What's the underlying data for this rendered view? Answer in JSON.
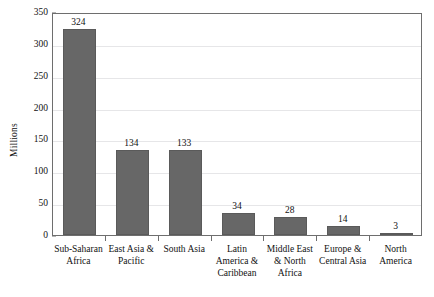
{
  "chart_data": {
    "type": "bar",
    "title": "",
    "xlabel": "",
    "ylabel": "Millions",
    "categories": [
      "Sub-Saharan Africa",
      "East Asia & Pacific",
      "South Asia",
      "Latin America & Caribbean",
      "Middle East & North Africa",
      "Europe & Central Asia",
      "North America"
    ],
    "category_lines": [
      [
        "Sub-Saharan",
        "Africa"
      ],
      [
        "East Asia &",
        "Pacific"
      ],
      [
        "South Asia"
      ],
      [
        "Latin",
        "America &",
        "Caribbean"
      ],
      [
        "Middle East",
        "& North",
        "Africa"
      ],
      [
        "Europe &",
        "Central Asia"
      ],
      [
        "North",
        "America"
      ]
    ],
    "values": [
      324,
      134,
      133,
      34,
      28,
      14,
      3
    ],
    "value_labels": [
      "324",
      "134",
      "133",
      "34",
      "28",
      "14",
      "3"
    ],
    "ylim": [
      0,
      350
    ],
    "ytick_labels": [
      "350",
      "300",
      "250",
      "200",
      "150",
      "100",
      "50",
      "0"
    ],
    "ytick_values": [
      350,
      300,
      250,
      200,
      150,
      100,
      50,
      0
    ],
    "grid": true,
    "grid_axis": "y",
    "legend": "none",
    "colors": {
      "bar_fill": "#676767",
      "bar_stroke": "#5a5a5a",
      "gridline": "#e6e6e8",
      "frame": "#6e6e6e",
      "text": "#111111",
      "background": "#ffffff"
    }
  }
}
